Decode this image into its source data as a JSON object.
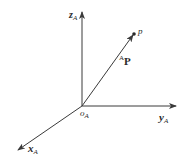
{
  "diagram": {
    "title": "",
    "colors": {
      "line": "#3a3a3a",
      "background": "#ffffff"
    },
    "origin": {
      "label_main": "o",
      "label_sub": "A",
      "x": 82,
      "y": 106
    },
    "axes": [
      {
        "name": "z",
        "label_main": "z",
        "label_sub": "A",
        "end": [
          82,
          12
        ]
      },
      {
        "name": "y",
        "label_main": "y",
        "label_sub": "A",
        "end": [
          176,
          106
        ]
      },
      {
        "name": "x",
        "label_main": "x",
        "label_sub": "A",
        "end": [
          18,
          150
        ]
      }
    ],
    "point": {
      "label": "p",
      "x": 134,
      "y": 34
    },
    "vector": {
      "label_sup": "A",
      "label_main": "P",
      "from": [
        82,
        106
      ],
      "to": [
        134,
        34
      ]
    }
  }
}
